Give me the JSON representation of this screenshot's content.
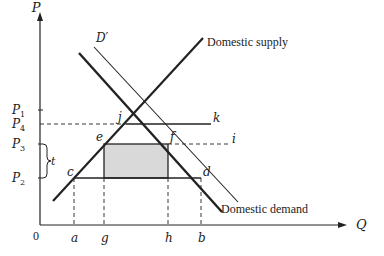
{
  "diagram": {
    "axes": {
      "y_label": "P",
      "x_label": "Q",
      "origin_label": "0"
    },
    "price_labels": [
      {
        "id": "P1",
        "base": "P",
        "sub": "1"
      },
      {
        "id": "P4",
        "base": "P",
        "sub": "4"
      },
      {
        "id": "P3",
        "base": "P",
        "sub": "3"
      },
      {
        "id": "P2",
        "base": "P",
        "sub": "2"
      }
    ],
    "tariff_label": "t",
    "quantity_labels": [
      "a",
      "g",
      "h",
      "b"
    ],
    "point_labels": {
      "j": "j",
      "k": "k",
      "e": "e",
      "f": "f",
      "i": "i",
      "c": "c",
      "d": "d"
    },
    "curves": {
      "supply": "Domestic supply",
      "demand": "Domestic demand",
      "shifted_demand": "D′"
    },
    "colors": {
      "line": "#222222",
      "shaded_area": "#d9d9d9",
      "background": "#ffffff"
    }
  }
}
